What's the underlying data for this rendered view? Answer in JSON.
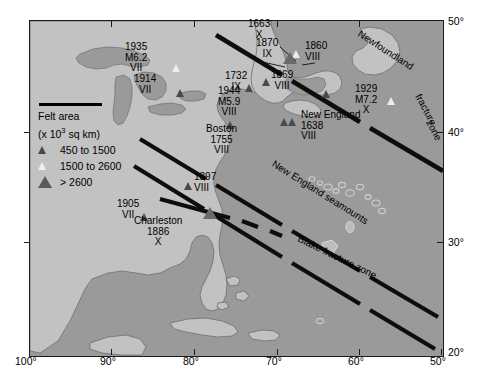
{
  "map": {
    "title": "Historical seismicity of eastern North America and western Atlantic",
    "background_ocean_color": "#9a9a9a",
    "land_color": "#c2c2c2",
    "frame_color": "#1a1a1a"
  },
  "axes": {
    "longitude_ticks": [
      "100°",
      "90°",
      "80°",
      "70°",
      "60°",
      "50°"
    ],
    "latitude_ticks": [
      "50°",
      "40°",
      "30°",
      "20°"
    ]
  },
  "legend": {
    "title": "Felt area",
    "units": "(x 10",
    "units_sup": "3",
    "units_tail": " sq km)",
    "entries": [
      {
        "symbol": "small-filled-triangle",
        "label": "450 to  1500"
      },
      {
        "symbol": "open-triangle",
        "label": "1500 to  2600"
      },
      {
        "symbol": "large-filled-triangle",
        "label": "> 2600"
      }
    ]
  },
  "earthquakes": [
    {
      "year": "1935",
      "magnitude": "M6.2",
      "intensity": "VII",
      "symbol": "open-triangle"
    },
    {
      "year": "1914",
      "magnitude": "",
      "intensity": "VII",
      "symbol": "small-filled-triangle"
    },
    {
      "year": "1663",
      "magnitude": "",
      "intensity": "X",
      "symbol": "open-triangle"
    },
    {
      "year": "1870",
      "magnitude": "",
      "intensity": "IX",
      "symbol": "large-filled-triangle"
    },
    {
      "year": "1860",
      "magnitude": "",
      "intensity": "VIII",
      "symbol": "open-triangle"
    },
    {
      "year": "1732",
      "magnitude": "",
      "intensity": "IX",
      "symbol": "small-filled-triangle"
    },
    {
      "year": "1869",
      "magnitude": "",
      "intensity": "VIII",
      "symbol": "small-filled-triangle"
    },
    {
      "year": "1944",
      "magnitude": "M5.9",
      "intensity": "VIII",
      "symbol": "small-filled-triangle"
    },
    {
      "year": "1929",
      "magnitude": "M7.2",
      "intensity": "X",
      "symbol": "open-triangle"
    },
    {
      "year": "1755",
      "magnitude": "",
      "intensity": "VIII",
      "place": "Boston",
      "symbol": "small-filled-triangle"
    },
    {
      "year": "1638",
      "magnitude": "",
      "intensity": "VIII",
      "place": "New England",
      "symbol": "small-filled-triangle"
    },
    {
      "year": "1897",
      "magnitude": "",
      "intensity": "VIII",
      "symbol": "small-filled-triangle"
    },
    {
      "year": "1905",
      "magnitude": "",
      "intensity": "VII",
      "symbol": "small-filled-triangle"
    },
    {
      "year": "1886",
      "magnitude": "",
      "intensity": "X",
      "place": "Charleston",
      "symbol": "large-filled-triangle"
    }
  ],
  "labels": {
    "l1935": "1935",
    "l1935m": "M6.2",
    "l1935i": "VII",
    "l1914": "1914",
    "l1914i": "VII",
    "l1663": "1663",
    "l1663i": "X",
    "l1870": "1870",
    "l1870i": "IX",
    "l1860": "1860",
    "l1860i": "VIII",
    "l1732": "1732",
    "l1732i": "IX",
    "l1869": "1869",
    "l1869i": "VIII",
    "l1944": "1944",
    "l1944m": "M5.9",
    "l1944i": "VIII",
    "l1929": "1929",
    "l1929m": "M7.2",
    "l1929i": "X",
    "boston": "Boston",
    "l1755": "1755",
    "l1755i": "VIII",
    "newengland": "New England",
    "l1638": "1638",
    "l1638i": "VIII",
    "l1897": "1897",
    "l1897i": "VIII",
    "l1905": "1905",
    "l1905i": "VII",
    "charleston": "Charleston",
    "l1886": "1886",
    "l1886i": "X"
  },
  "features": [
    {
      "name": "Newfoundland fracture zone",
      "line1": "Newfoundland",
      "line2": "fracture",
      "line3": "zone"
    },
    {
      "name": "New England seamounts",
      "text": "New England seamounts"
    },
    {
      "name": "Blake fracture zone",
      "text": "Blake fracture zone"
    }
  ],
  "feature_text": {
    "newfoundland": "Newfoundland",
    "fracture": "fracture",
    "zone": "zone",
    "seamounts": "New England seamounts",
    "blake": "Blake fracture zone"
  }
}
